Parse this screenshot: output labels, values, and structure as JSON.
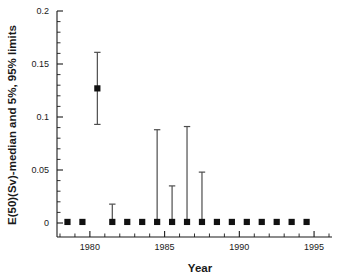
{
  "chart_data": {
    "type": "scatter",
    "title": "",
    "xlabel": "Year",
    "ylabel": "E(50)(Sv)-median and 5%, 95% limits",
    "xlim": [
      1977.8,
      1996.2
    ],
    "ylim": [
      0,
      0.2
    ],
    "grid": false,
    "legend": null,
    "x_ticks_major": [
      1980,
      1985,
      1990,
      1995
    ],
    "x_tick_labels": [
      "1980",
      "1985",
      "1990",
      "1995"
    ],
    "x_ticks_minor_step": 1,
    "y_ticks_major": [
      0,
      0.05,
      0.1,
      0.15,
      0.2
    ],
    "y_tick_labels": [
      "0",
      "0.05",
      "0.1",
      "0.15",
      "0.2"
    ],
    "y_ticks_minor_step": 0.01,
    "marker_style": "filled-square",
    "series": [
      {
        "name": "E(50)(Sv) median with 5% and 95% limits",
        "x": [
          1978.5,
          1979.5,
          1980.5,
          1981.5,
          1982.5,
          1983.5,
          1984.5,
          1985.5,
          1986.5,
          1987.5,
          1988.5,
          1989.5,
          1990.5,
          1991.5,
          1992.5,
          1993.5,
          1994.5
        ],
        "median": [
          0.001,
          0.001,
          0.127,
          0.001,
          0.001,
          0.001,
          0.001,
          0.001,
          0.001,
          0.001,
          0.001,
          0.001,
          0.001,
          0.001,
          0.001,
          0.001,
          0.001
        ],
        "lower_5pct": [
          0.001,
          0.001,
          0.093,
          0.001,
          0.001,
          0.001,
          0.001,
          0.001,
          0.001,
          0.001,
          0.001,
          0.001,
          0.001,
          0.001,
          0.001,
          0.001,
          0.001
        ],
        "upper_95pct": [
          0.001,
          0.001,
          0.161,
          0.0178,
          0.001,
          0.001,
          0.088,
          0.035,
          0.091,
          0.048,
          0.001,
          0.001,
          0.001,
          0.001,
          0.001,
          0.001,
          0.001
        ]
      }
    ]
  }
}
